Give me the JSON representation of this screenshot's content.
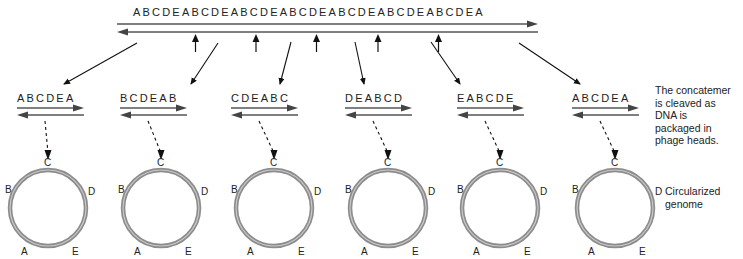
{
  "concatemer": {
    "sequence": "ABCDEABCDEABCDEABCDEABCDEABCDEABCDEA",
    "cleavage_site_count": 5
  },
  "fragments": [
    {
      "sequence": "ABCDEA"
    },
    {
      "sequence": "BCDEAB"
    },
    {
      "sequence": "CDEABC"
    },
    {
      "sequence": "DEABCD"
    },
    {
      "sequence": "EABCDE"
    },
    {
      "sequence": "ABCDEA"
    }
  ],
  "circle_labels": {
    "top": "C",
    "left": "B",
    "right": "D",
    "bottom_left": "A",
    "bottom_right": "E"
  },
  "annotations": {
    "cleavage_note": [
      "The concatemer",
      "is cleaved as",
      "DNA is",
      "packaged in",
      "phage heads."
    ],
    "circular_note": [
      "Circularized",
      "genome"
    ]
  },
  "colors": {
    "strand": "#4a4a4a",
    "ring": "#8c8c8c",
    "ring_highlight": "#c8c8c8",
    "text": "#222222"
  }
}
